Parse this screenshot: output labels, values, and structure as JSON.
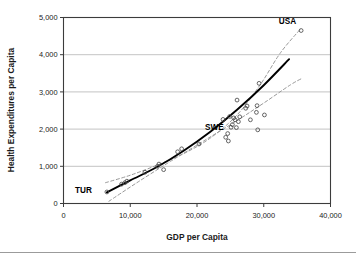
{
  "chart_data": {
    "type": "scatter",
    "title": "",
    "xlabel": "GDP per Capita",
    "ylabel": "Health Expenditures per Capita",
    "xlim": [
      0,
      40000
    ],
    "ylim": [
      0,
      5000
    ],
    "xticks": [
      0,
      10000,
      20000,
      30000,
      40000
    ],
    "yticks": [
      0,
      1000,
      2000,
      3000,
      4000,
      5000
    ],
    "xticklabels": [
      "0",
      "10,000",
      "20,000",
      "30,000",
      "40,000"
    ],
    "yticklabels": [
      "0",
      "1,000",
      "2,000",
      "3,000",
      "4,000",
      "5,000"
    ],
    "grid": "horizontal",
    "legend": "none",
    "marker_style": "open-circle",
    "points": [
      {
        "x": 6500,
        "y": 310
      },
      {
        "x": 8700,
        "y": 520
      },
      {
        "x": 9200,
        "y": 560
      },
      {
        "x": 9500,
        "y": 600
      },
      {
        "x": 12200,
        "y": 840
      },
      {
        "x": 14100,
        "y": 1000
      },
      {
        "x": 14300,
        "y": 1060
      },
      {
        "x": 15000,
        "y": 910
      },
      {
        "x": 17100,
        "y": 1390
      },
      {
        "x": 17700,
        "y": 1470
      },
      {
        "x": 20300,
        "y": 1600
      },
      {
        "x": 23900,
        "y": 2260
      },
      {
        "x": 24300,
        "y": 1780
      },
      {
        "x": 24600,
        "y": 1880
      },
      {
        "x": 24700,
        "y": 1680
      },
      {
        "x": 24900,
        "y": 2340
      },
      {
        "x": 25100,
        "y": 2050
      },
      {
        "x": 25300,
        "y": 2120
      },
      {
        "x": 25500,
        "y": 2300
      },
      {
        "x": 25700,
        "y": 2250
      },
      {
        "x": 25900,
        "y": 2040
      },
      {
        "x": 26000,
        "y": 2780
      },
      {
        "x": 26200,
        "y": 2200
      },
      {
        "x": 26400,
        "y": 2330
      },
      {
        "x": 27300,
        "y": 2560
      },
      {
        "x": 27500,
        "y": 2620
      },
      {
        "x": 28000,
        "y": 2250
      },
      {
        "x": 28900,
        "y": 2450
      },
      {
        "x": 29000,
        "y": 2630
      },
      {
        "x": 29100,
        "y": 1980
      },
      {
        "x": 29300,
        "y": 3230
      },
      {
        "x": 30100,
        "y": 2380
      },
      {
        "x": 35600,
        "y": 4650
      }
    ],
    "annotations": [
      {
        "label": "TUR",
        "x": 6500,
        "y": 310
      },
      {
        "label": "SWE",
        "x": 24300,
        "y": 1950
      },
      {
        "label": "USA",
        "x": 35600,
        "y": 4650
      }
    ],
    "series": [
      {
        "name": "fit-curve",
        "style": "solid",
        "color": "#000000",
        "points": [
          {
            "x": 6500,
            "y": 300
          },
          {
            "x": 10000,
            "y": 620
          },
          {
            "x": 14000,
            "y": 980
          },
          {
            "x": 18000,
            "y": 1420
          },
          {
            "x": 22000,
            "y": 1930
          },
          {
            "x": 26000,
            "y": 2520
          },
          {
            "x": 30000,
            "y": 3180
          },
          {
            "x": 33800,
            "y": 3880
          }
        ]
      },
      {
        "name": "upper-band",
        "style": "dashed",
        "color": "#9a9a9a",
        "points": [
          {
            "x": 6300,
            "y": 560
          },
          {
            "x": 10000,
            "y": 760
          },
          {
            "x": 14000,
            "y": 1030
          },
          {
            "x": 18000,
            "y": 1340
          },
          {
            "x": 22000,
            "y": 1760
          },
          {
            "x": 26000,
            "y": 2380
          },
          {
            "x": 29500,
            "y": 3200
          },
          {
            "x": 32500,
            "y": 4050
          },
          {
            "x": 35500,
            "y": 4690
          }
        ]
      },
      {
        "name": "lower-band",
        "style": "dashed",
        "color": "#9a9a9a",
        "points": [
          {
            "x": 6800,
            "y": 60
          },
          {
            "x": 11000,
            "y": 560
          },
          {
            "x": 16000,
            "y": 1130
          },
          {
            "x": 21000,
            "y": 1680
          },
          {
            "x": 26000,
            "y": 2230
          },
          {
            "x": 30000,
            "y": 2700
          },
          {
            "x": 34000,
            "y": 3190
          },
          {
            "x": 35800,
            "y": 3370
          }
        ]
      }
    ]
  }
}
